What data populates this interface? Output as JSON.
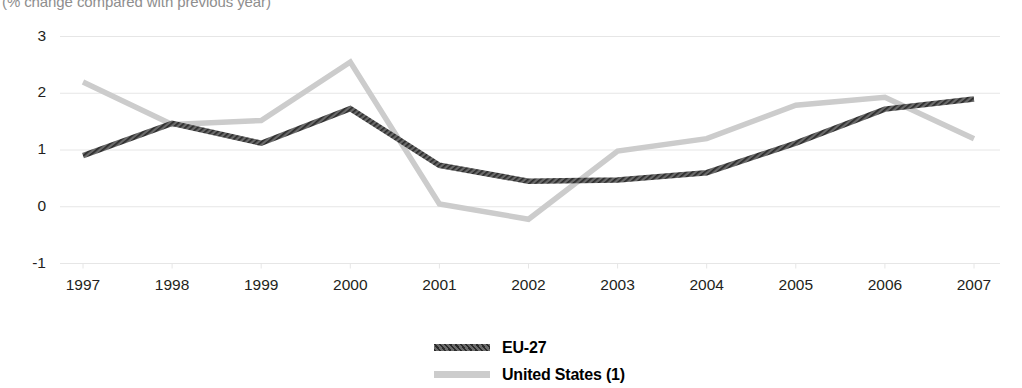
{
  "subtitle": "(% change compared with previous year)",
  "legend": {
    "items": [
      {
        "label": "EU-27",
        "color": "#595959",
        "style": "hatched"
      },
      {
        "label": "United States (1)",
        "color": "#cccccc",
        "style": "solid"
      }
    ]
  },
  "chart_data": {
    "type": "line",
    "title": "",
    "subtitle": "(% change compared with previous year)",
    "xlabel": "",
    "ylabel": "",
    "categories": [
      "1997",
      "1998",
      "1999",
      "2000",
      "2001",
      "2002",
      "2003",
      "2004",
      "2005",
      "2006",
      "2007"
    ],
    "x_tick_labels": [
      "1997",
      "1998",
      "1999",
      "2000",
      "2001",
      "2002",
      "2003",
      "2004",
      "2005",
      "2006",
      "2007"
    ],
    "y_tick_labels": [
      "3",
      "2",
      "1",
      "0",
      "-1"
    ],
    "y_ticks": [
      3,
      2,
      1,
      0,
      -1
    ],
    "ylim": [
      -1,
      3
    ],
    "grid": true,
    "grid_axis": "y",
    "legend_position": "bottom",
    "series": [
      {
        "name": "EU-27",
        "color": "#595959",
        "style": "hatched",
        "values": [
          0.9,
          1.47,
          1.12,
          1.73,
          0.73,
          0.45,
          0.47,
          0.6,
          1.12,
          1.72,
          1.9
        ]
      },
      {
        "name": "United States (1)",
        "color": "#cccccc",
        "style": "solid",
        "values": [
          2.2,
          1.45,
          1.52,
          2.55,
          0.05,
          -0.22,
          0.98,
          1.2,
          1.79,
          1.93,
          1.2
        ]
      }
    ]
  }
}
